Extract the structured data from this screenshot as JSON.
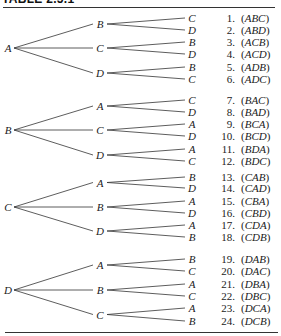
{
  "title": "TABLE 2.5.1",
  "tree": [
    {
      "label": "A",
      "children": [
        {
          "label": "B",
          "leaves": [
            "C",
            "D"
          ]
        },
        {
          "label": "C",
          "leaves": [
            "B",
            "D"
          ]
        },
        {
          "label": "D",
          "leaves": [
            "B",
            "C"
          ]
        }
      ]
    },
    {
      "label": "B",
      "children": [
        {
          "label": "A",
          "leaves": [
            "C",
            "D"
          ]
        },
        {
          "label": "C",
          "leaves": [
            "A",
            "D"
          ]
        },
        {
          "label": "D",
          "leaves": [
            "A",
            "C"
          ]
        }
      ]
    },
    {
      "label": "C",
      "children": [
        {
          "label": "A",
          "leaves": [
            "B",
            "D"
          ]
        },
        {
          "label": "B",
          "leaves": [
            "A",
            "D"
          ]
        },
        {
          "label": "D",
          "leaves": [
            "A",
            "B"
          ]
        }
      ]
    },
    {
      "label": "D",
      "children": [
        {
          "label": "A",
          "leaves": [
            "B",
            "C"
          ]
        },
        {
          "label": "B",
          "leaves": [
            "A",
            "C"
          ]
        },
        {
          "label": "C",
          "leaves": [
            "A",
            "B"
          ]
        }
      ]
    }
  ],
  "rows": [
    {
      "num": "1.",
      "perm": "ABC"
    },
    {
      "num": "2.",
      "perm": "ABD"
    },
    {
      "num": "3.",
      "perm": "ACB"
    },
    {
      "num": "4.",
      "perm": "ACD"
    },
    {
      "num": "5.",
      "perm": "ADB"
    },
    {
      "num": "6.",
      "perm": "ADC"
    },
    {
      "num": "7.",
      "perm": "BAC"
    },
    {
      "num": "8.",
      "perm": "BAD"
    },
    {
      "num": "9.",
      "perm": "BCA"
    },
    {
      "num": "10.",
      "perm": "BCD"
    },
    {
      "num": "11.",
      "perm": "BDA"
    },
    {
      "num": "12.",
      "perm": "BDC"
    },
    {
      "num": "13.",
      "perm": "CAB"
    },
    {
      "num": "14.",
      "perm": "CAD"
    },
    {
      "num": "15.",
      "perm": "CBA"
    },
    {
      "num": "16.",
      "perm": "CBD"
    },
    {
      "num": "17.",
      "perm": "CDA"
    },
    {
      "num": "18.",
      "perm": "CDB"
    },
    {
      "num": "19.",
      "perm": "DAB"
    },
    {
      "num": "20.",
      "perm": "DAC"
    },
    {
      "num": "21.",
      "perm": "DBA"
    },
    {
      "num": "22.",
      "perm": "DBC"
    },
    {
      "num": "23.",
      "perm": "DCA"
    },
    {
      "num": "24.",
      "perm": "DCB"
    }
  ]
}
